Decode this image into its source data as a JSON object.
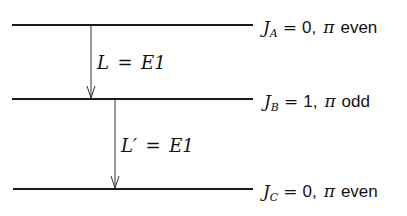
{
  "diagram": {
    "type": "energy-level-decay-scheme",
    "levels": [
      {
        "id": "A",
        "symbol": "J",
        "subscript": "A",
        "spin": "0",
        "parity_symbol": "π",
        "parity": "even",
        "y": 25
      },
      {
        "id": "B",
        "symbol": "J",
        "subscript": "B",
        "spin": "1",
        "parity_symbol": "π",
        "parity": "odd",
        "y": 99
      },
      {
        "id": "C",
        "symbol": "J",
        "subscript": "C",
        "spin": "0",
        "parity_symbol": "π",
        "parity": "even",
        "y": 189
      }
    ],
    "transitions": [
      {
        "from": "A",
        "to": "B",
        "label_var": "L",
        "label_eq": "=",
        "label_val": "E1",
        "x": 91
      },
      {
        "from": "B",
        "to": "C",
        "label_var": "L′",
        "label_eq": "=",
        "label_val": "E1",
        "x": 115
      }
    ],
    "colors": {
      "line": "#1a1a1a",
      "text": "#111111",
      "background": "#ffffff"
    }
  }
}
